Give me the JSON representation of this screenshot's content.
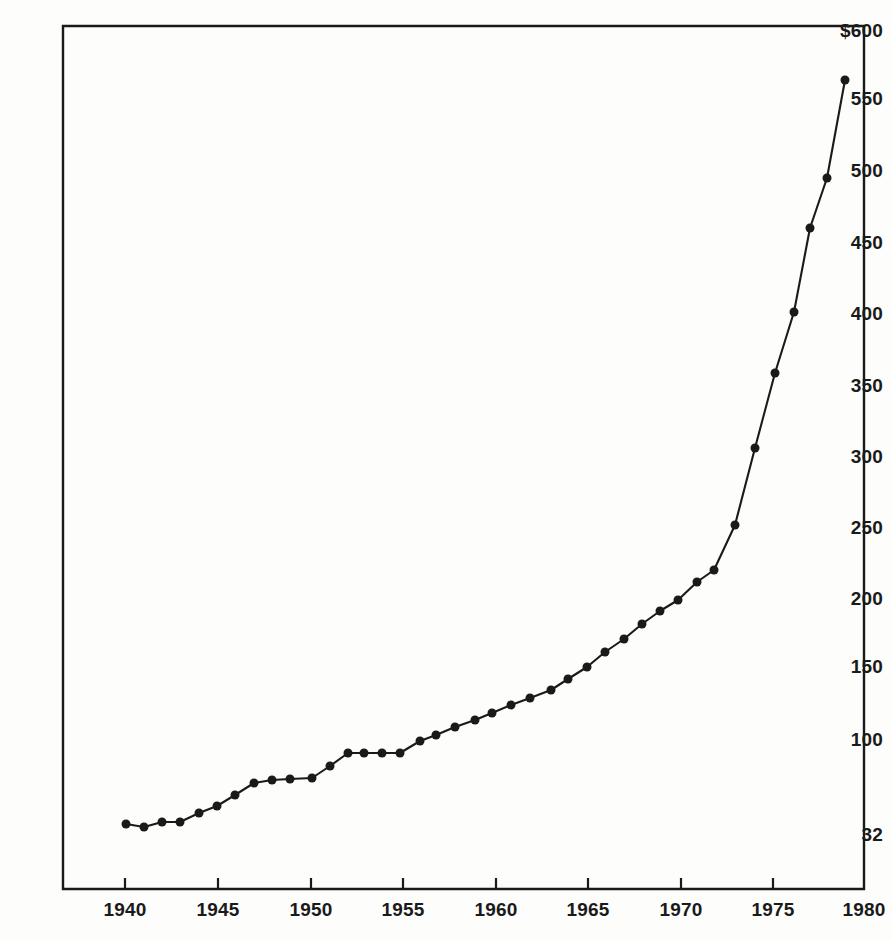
{
  "chart_data": {
    "type": "line",
    "title": "",
    "subtitle": "",
    "xlabel": "",
    "ylabel": "",
    "currency_symbol": "$",
    "x": [
      1940,
      1941,
      1942,
      1943,
      1944,
      1945,
      1946,
      1947,
      1948,
      1949,
      1950,
      1951,
      1952,
      1953,
      1954,
      1955,
      1956,
      1957,
      1958,
      1959,
      1960,
      1961,
      1962,
      1963,
      1964,
      1965,
      1966,
      1967,
      1968,
      1969,
      1970,
      1971,
      1972,
      1973,
      1974,
      1975,
      1976,
      1977,
      1978,
      1979
    ],
    "values": [
      35,
      33,
      36,
      36,
      42,
      47,
      55,
      63,
      65,
      68,
      75,
      90,
      92,
      92,
      92,
      92,
      100,
      104,
      113,
      118,
      120,
      122,
      131,
      138,
      147,
      158,
      167,
      177,
      186,
      195,
      200,
      207,
      220,
      303,
      250,
      348,
      395,
      457,
      493,
      562
    ],
    "series": [
      {
        "name": "value",
        "values": [
          35,
          33,
          36,
          36,
          42,
          47,
          55,
          63,
          65,
          68,
          75,
          90,
          92,
          92,
          92,
          92,
          100,
          104,
          113,
          118,
          120,
          122,
          131,
          138,
          147,
          158,
          167,
          177,
          186,
          195,
          200,
          207,
          220,
          250,
          303,
          348,
          395,
          457,
          493,
          562
        ]
      }
    ],
    "y_ticks": [
      {
        "label": "$600",
        "value": 600,
        "y": 30
      },
      {
        "label": "550",
        "value": 550,
        "y": 98
      },
      {
        "label": "500",
        "value": 500,
        "y": 170
      },
      {
        "label": "450",
        "value": 450,
        "y": 242
      },
      {
        "label": "400",
        "value": 400,
        "y": 313
      },
      {
        "label": "350",
        "value": 350,
        "y": 385
      },
      {
        "label": "300",
        "value": 300,
        "y": 456
      },
      {
        "label": "250",
        "value": 250,
        "y": 527
      },
      {
        "label": "200",
        "value": 200,
        "y": 598
      },
      {
        "label": "150",
        "value": 150,
        "y": 666
      },
      {
        "label": "100",
        "value": 100,
        "y": 739
      },
      {
        "label": "32",
        "value": 32,
        "y": 834
      }
    ],
    "x_ticks": [
      {
        "label": "1940",
        "value": 1940,
        "x": 125
      },
      {
        "label": "1945",
        "value": 1945,
        "x": 218
      },
      {
        "label": "1950",
        "value": 1950,
        "x": 311
      },
      {
        "label": "1955",
        "value": 1955,
        "x": 403
      },
      {
        "label": "1960",
        "value": 1960,
        "x": 496
      },
      {
        "label": "1965",
        "value": 1965,
        "x": 588
      },
      {
        "label": "1970",
        "value": 1970,
        "x": 681
      },
      {
        "label": "1975",
        "value": 1975,
        "x": 773
      },
      {
        "label": "1980",
        "value": 1980,
        "x": 864
      }
    ],
    "xlim": [
      1937.3,
      1980
    ],
    "ylim": [
      0,
      600
    ],
    "grid": false,
    "legend": null,
    "marker": "filled-circle",
    "marker_size": 9,
    "line_color": "#1a1a1a",
    "marker_color": "#1a1a1a",
    "axis_color": "#1a1a1a",
    "background_color": "#fdfdfc",
    "points_px": [
      [
        126,
        824
      ],
      [
        144,
        827
      ],
      [
        162,
        822
      ],
      [
        180,
        822
      ],
      [
        199,
        813
      ],
      [
        217,
        806
      ],
      [
        235,
        795
      ],
      [
        254,
        783
      ],
      [
        272,
        780
      ],
      [
        290,
        779
      ],
      [
        312,
        778
      ],
      [
        330,
        766
      ],
      [
        348,
        753
      ],
      [
        364,
        753
      ],
      [
        382,
        753
      ],
      [
        400,
        753
      ],
      [
        420,
        741
      ],
      [
        436,
        735
      ],
      [
        455,
        727
      ],
      [
        475,
        720
      ],
      [
        492,
        713
      ],
      [
        511,
        705
      ],
      [
        530,
        698
      ],
      [
        551,
        690
      ],
      [
        568,
        679
      ],
      [
        587,
        667
      ],
      [
        605,
        652
      ],
      [
        624,
        639
      ],
      [
        642,
        624
      ],
      [
        660,
        611
      ],
      [
        678,
        600
      ],
      [
        697,
        582
      ],
      [
        714,
        570
      ],
      [
        735,
        525
      ],
      [
        755,
        448
      ],
      [
        775,
        373
      ],
      [
        794,
        312
      ],
      [
        810,
        228
      ],
      [
        827,
        178
      ],
      [
        845,
        80
      ]
    ]
  },
  "axes": {
    "frame": {
      "left": 63,
      "right": 864,
      "top": 26,
      "bottom": 889
    },
    "tick_length": 11
  }
}
